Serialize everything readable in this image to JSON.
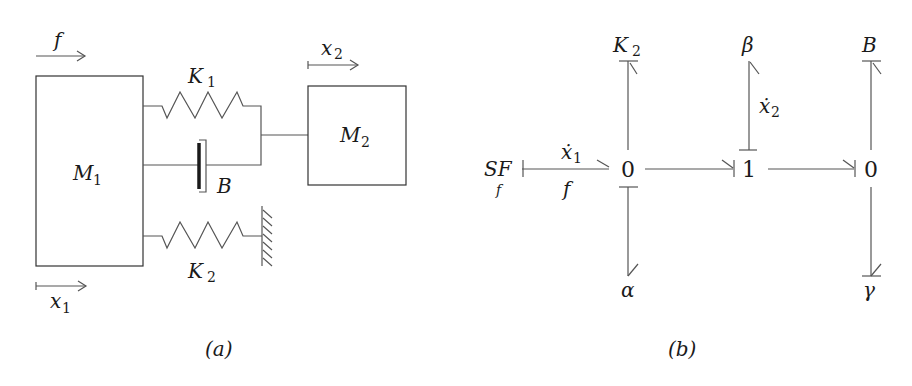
{
  "figure_a": {
    "caption": "(a)",
    "force_label": "f",
    "x1_label": "x",
    "x1_sub": "1",
    "x2_label": "x",
    "x2_sub": "2",
    "mass1_label": "M",
    "mass1_sub": "1",
    "mass2_label": "M",
    "mass2_sub": "2",
    "spring1_label": "K",
    "spring1_sub": "1",
    "spring2_label": "K",
    "spring2_sub": "2",
    "damper_label": "B"
  },
  "figure_b": {
    "caption": "(b)",
    "source_label": "SF",
    "source_sub": "f",
    "bond1_top": "ẋ",
    "bond1_top_sub": "1",
    "bond1_bottom": "f",
    "junction_left": "0",
    "junction_mid": "1",
    "junction_right": "0",
    "k2_label": "K",
    "k2_sub": "2",
    "alpha_label": "α",
    "beta_label": "β",
    "x2dot_label": "ẋ",
    "x2dot_sub": "2",
    "b_label": "B",
    "gamma_label": "γ"
  },
  "colors": {
    "line": "#555555",
    "text": "#1a1a1a",
    "background": "#ffffff"
  }
}
